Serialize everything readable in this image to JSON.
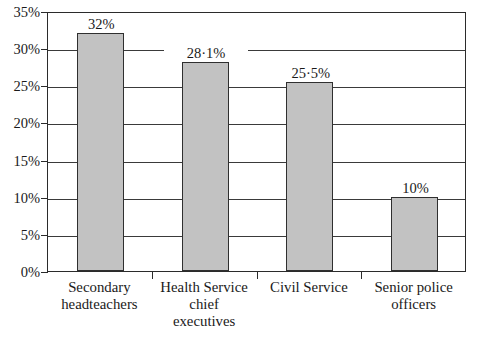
{
  "chart_data": {
    "type": "bar",
    "title": "",
    "subtitle": "",
    "xlabel": "",
    "ylabel": "",
    "categories": [
      "Secondary headteachers",
      "Health Service chief executives",
      "Civil Service",
      "Senior police officers"
    ],
    "category_lines": [
      [
        "Secondary",
        "headteachers"
      ],
      [
        "Health Service",
        "chief",
        "executives"
      ],
      [
        "Civil Service"
      ],
      [
        "Senior police",
        "officers"
      ]
    ],
    "values": [
      32,
      28.1,
      25.5,
      10
    ],
    "data_labels": [
      "32%",
      "28·1%",
      "25·5%",
      "10%"
    ],
    "ylim": [
      0,
      35
    ],
    "ytick_values": [
      0,
      5,
      10,
      15,
      20,
      25,
      30,
      35
    ],
    "ytick_labels": [
      "0%",
      "5%",
      "10%",
      "15%",
      "20%",
      "25%",
      "30%",
      "35%"
    ],
    "grid": true,
    "grid_axis": "y",
    "legend": "none",
    "bar_fill_color": "#c2c2c2",
    "bar_edge_color": "#2f2f2f",
    "axis_color": "#2b2b2b",
    "grid_color": "#3a3a3a",
    "background_color": "#ffffff"
  }
}
